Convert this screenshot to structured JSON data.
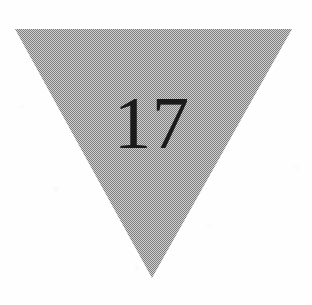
{
  "figure": {
    "shape_name": "inverted-triangle",
    "label": "17",
    "fill_style": "halftone-dither-gray",
    "fill_color": "#9b9b9b",
    "fill_light": "#c9c9c9",
    "fill_dark": "#8a8a8a",
    "label_color": "#1b1b1b",
    "background_color": "#fefefe",
    "vertices": {
      "top_left": "15,29",
      "top_right": "292,29",
      "bottom_apex": "152,278"
    }
  }
}
